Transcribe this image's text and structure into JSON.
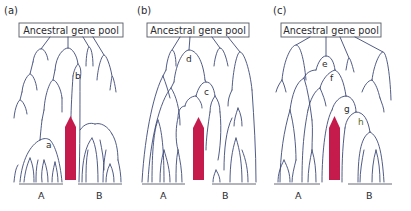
{
  "figure": {
    "panels": [
      {
        "label": "(a)",
        "box_text": "Ancestral gene pool",
        "groups": [
          "A",
          "B"
        ],
        "nodes": [
          "a",
          "b"
        ]
      },
      {
        "label": "(b)",
        "box_text": "Ancestral gene pool",
        "groups": [
          "A",
          "B"
        ],
        "nodes": [
          "c",
          "d"
        ]
      },
      {
        "label": "(c)",
        "box_text": "Ancestral gene pool",
        "groups": [
          "A",
          "B"
        ],
        "nodes": [
          "e",
          "f",
          "g",
          "h"
        ]
      }
    ],
    "colors": {
      "branch": "#3d4a78",
      "arrow": "#c41a4c",
      "box_border": "#555a66"
    }
  }
}
